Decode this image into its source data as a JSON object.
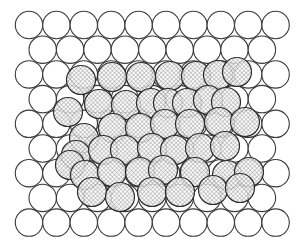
{
  "diagram": {
    "type": "circle-packing",
    "description_visible": "",
    "canvas": {
      "width": 304,
      "height": 248,
      "background": "#ffffff"
    },
    "grid": {
      "rows": 9,
      "odd_row_count": 10,
      "even_row_count": 9,
      "radius": 13.7,
      "spacing_x": 27.4,
      "spacing_y": 24.7,
      "origin_x": 29,
      "origin_y": 25,
      "stroke_color": "#3a3a3a"
    },
    "hatched": {
      "radius": 14.5,
      "pattern": "crosshatch",
      "pattern_color": "#8a8a8a",
      "stroke_color": "#2e2e2e",
      "circles": [
        [
          81,
          80
        ],
        [
          112,
          77
        ],
        [
          141,
          77
        ],
        [
          170,
          76
        ],
        [
          196,
          76
        ],
        [
          218,
          75
        ],
        [
          237,
          72
        ],
        [
          68,
          112
        ],
        [
          99,
          104
        ],
        [
          126,
          105
        ],
        [
          151,
          103
        ],
        [
          168,
          103
        ],
        [
          187,
          103
        ],
        [
          208,
          100
        ],
        [
          226,
          102
        ],
        [
          84,
          138
        ],
        [
          113,
          128
        ],
        [
          140,
          128
        ],
        [
          165,
          124
        ],
        [
          190,
          124
        ],
        [
          219,
          122
        ],
        [
          245,
          122
        ],
        [
          76,
          155
        ],
        [
          103,
          150
        ],
        [
          125,
          150
        ],
        [
          152,
          148
        ],
        [
          175,
          150
        ],
        [
          200,
          148
        ],
        [
          225,
          146
        ],
        [
          70,
          165
        ],
        [
          85,
          175
        ],
        [
          112,
          172
        ],
        [
          140,
          172
        ],
        [
          163,
          170
        ],
        [
          195,
          172
        ],
        [
          227,
          175
        ],
        [
          249,
          172
        ],
        [
          92,
          192
        ],
        [
          120,
          197
        ],
        [
          152,
          192
        ],
        [
          180,
          192
        ],
        [
          213,
          190
        ],
        [
          240,
          188
        ]
      ]
    }
  }
}
